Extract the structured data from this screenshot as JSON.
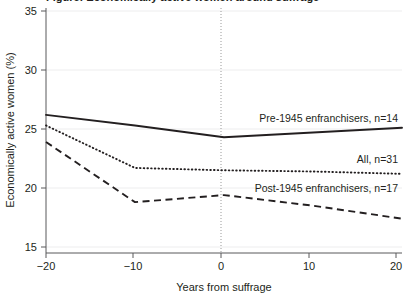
{
  "figure": {
    "background_color": "#ffffff",
    "ink_color": "#231f20",
    "gridline_color": "#ededee",
    "reference_line_color": "#9a9a9a",
    "cropped_title_fragment": "Figure: Economically active women around suffrage"
  },
  "chart_data": {
    "type": "line",
    "title": "",
    "xlabel": "Years from suffrage",
    "ylabel": "Economically active women (%)",
    "x": [
      -20,
      -10,
      0,
      10,
      20
    ],
    "xlim": [
      -20,
      20
    ],
    "ylim": [
      15,
      35
    ],
    "xticks": [
      -20,
      -10,
      0,
      10,
      20
    ],
    "xtick_labels": [
      "−20",
      "−10",
      "0",
      "10",
      "20"
    ],
    "yticks": [
      15,
      20,
      25,
      30,
      35
    ],
    "ytick_labels": [
      "15",
      "20",
      "25",
      "30",
      "35"
    ],
    "grid": true,
    "grid_axis": "y",
    "legend_position": "inline-right",
    "annotations": [
      {
        "text": "Pre-1945 enfranchisers, n=14",
        "x": 20,
        "y": 26.3
      },
      {
        "text": "All, n=31",
        "x": 20,
        "y": 22.8
      },
      {
        "text": "Post-1945 enfranchisers, n=17",
        "x": 20,
        "y": 20.4
      }
    ],
    "reference_lines": [
      {
        "axis": "x",
        "value": 0,
        "style": "dotted"
      }
    ],
    "series": [
      {
        "name": "Pre-1945 enfranchisers, n=14",
        "line_style": "solid",
        "values": [
          26.2,
          25.3,
          24.3,
          24.7,
          25.1
        ]
      },
      {
        "name": "All, n=31",
        "line_style": "dotted",
        "values": [
          25.3,
          21.7,
          21.5,
          21.4,
          21.2
        ]
      },
      {
        "name": "Post-1945 enfranchisers, n=17",
        "line_style": "dashed",
        "values": [
          23.9,
          18.8,
          19.4,
          18.5,
          17.4
        ]
      }
    ]
  }
}
